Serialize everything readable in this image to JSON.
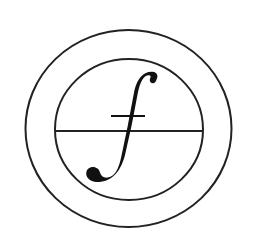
{
  "logo": {
    "glyph": "f",
    "description": "Italic integral-style f inside two concentric circles, bisected by a horizontal line",
    "colors": {
      "background": "#ffffff",
      "stroke": "#222222",
      "glyph": "#111111"
    },
    "geometry": {
      "outer_circle": {
        "cx": 128.5,
        "cy": 128.5,
        "rx": 103,
        "ry": 98.5,
        "stroke_width": 2
      },
      "inner_circle": {
        "cx": 129,
        "cy": 129.5,
        "rx": 74,
        "ry": 70.5,
        "stroke_width": 2
      },
      "divider_line": {
        "x1": 55,
        "x2": 203,
        "y": 131,
        "stroke_width": 2
      },
      "crossbar": {
        "x1": 111,
        "x2": 145,
        "y": 116,
        "stroke_width": 2
      }
    }
  }
}
